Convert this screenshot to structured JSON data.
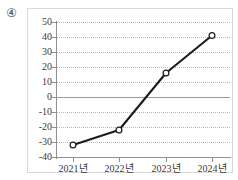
{
  "item_number": "④",
  "chart_data": {
    "type": "line",
    "title": "",
    "xlabel": "",
    "ylabel": "",
    "categories": [
      "2021년",
      "2022년",
      "2023년",
      "2024년"
    ],
    "x_tick_labels": [
      "2021년",
      "2022년",
      "2023년",
      "2024년"
    ],
    "values": [
      -32,
      -22,
      16,
      41
    ],
    "series": [
      {
        "name": "",
        "values": [
          -32,
          -22,
          16,
          41
        ]
      }
    ],
    "ylim": [
      -40,
      50
    ],
    "y_ticks": [
      50,
      40,
      30,
      20,
      10,
      0,
      -10,
      -20,
      -30,
      -40
    ],
    "y_tick_labels": [
      "50",
      "40",
      "30",
      "20",
      "10",
      "0",
      "-10",
      "-20",
      "-30",
      "-40"
    ],
    "grid": true,
    "grid_style": "dotted",
    "zero_line": true,
    "legend": false,
    "marker": "open-circle",
    "line_color": "#1c1c1c",
    "marker_fill": "#ffffff",
    "marker_stroke": "#1c1c1c",
    "grid_color": "#b9b9b9",
    "axis_color": "#8f8f8f",
    "text_color": "#3a3a3a"
  }
}
